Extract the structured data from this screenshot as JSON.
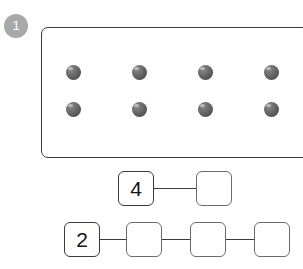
{
  "page": {
    "background_color": "#ffffff",
    "width": 303,
    "height": 269
  },
  "step_badge": {
    "label": "1",
    "color": "#a8a8a8",
    "text_color": "#ffffff"
  },
  "dot_panel": {
    "name": "counter-dots-panel",
    "border_color": "#3b3b3b",
    "dot_color": "#5a5a5a",
    "dot_highlight_color": "#b9b9b9",
    "rows": 2,
    "columns": 4,
    "total_dots": 8,
    "dots": [
      [
        {
          "id": "dot-r1-c1"
        },
        {
          "id": "dot-r1-c2"
        },
        {
          "id": "dot-r1-c3"
        },
        {
          "id": "dot-r1-c4"
        }
      ],
      [
        {
          "id": "dot-r2-c1"
        },
        {
          "id": "dot-r2-c2"
        },
        {
          "id": "dot-r2-c3"
        },
        {
          "id": "dot-r2-c4"
        }
      ]
    ]
  },
  "chains": [
    {
      "name": "skip-count-chain-by-four",
      "boxes": [
        {
          "value": "4",
          "filled": true
        },
        {
          "value": "",
          "filled": false
        }
      ]
    },
    {
      "name": "skip-count-chain-by-two",
      "boxes": [
        {
          "value": "2",
          "filled": true
        },
        {
          "value": "",
          "filled": false
        },
        {
          "value": "",
          "filled": false
        },
        {
          "value": "",
          "filled": false
        }
      ]
    }
  ]
}
